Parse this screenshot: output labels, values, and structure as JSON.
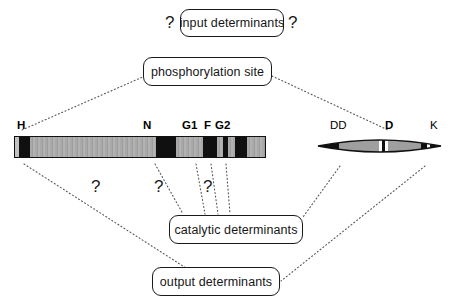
{
  "diagram": {
    "background_color": "#ffffff",
    "line_color": "#555555",
    "stroke_color": "#1a1a1a",
    "bar_fill_color": "#a8a8a8",
    "motif_fill_color": "#101010"
  },
  "nodes": {
    "input": {
      "label": "input determinants",
      "x": 180,
      "y": 9,
      "w": 104,
      "h": 28
    },
    "phospho": {
      "label": "phosphorylation site",
      "x": 143,
      "y": 57,
      "w": 129,
      "h": 29
    },
    "catalytic": {
      "label": "catalytic determinants",
      "x": 169,
      "y": 215,
      "w": 134,
      "h": 29
    },
    "output": {
      "label": "output determinants",
      "x": 152,
      "y": 267,
      "w": 128,
      "h": 29
    }
  },
  "question_marks": [
    {
      "name": "input-left",
      "label": "?",
      "x": 165,
      "y": 14
    },
    {
      "name": "input-right",
      "label": "?",
      "x": 288,
      "y": 14
    },
    {
      "name": "bar-h",
      "label": "?",
      "x": 91,
      "y": 178
    },
    {
      "name": "bar-n",
      "label": "?",
      "x": 154,
      "y": 178
    },
    {
      "name": "bar-g1",
      "label": "?",
      "x": 203,
      "y": 178
    }
  ],
  "histidine_kinase_bar": {
    "name": "histidine-kinase-domain-bar",
    "x": 14,
    "y": 136,
    "w": 252,
    "h": 22,
    "segments": [
      {
        "name": "n-terminal-light",
        "shade": "light",
        "x": 0,
        "w": 4
      },
      {
        "name": "h-box-motif",
        "shade": "dark",
        "x": 4,
        "w": 11
      },
      {
        "name": "linker-1",
        "shade": "gray",
        "x": 15,
        "w": 126
      },
      {
        "name": "n-box-motif",
        "shade": "dark",
        "x": 141,
        "w": 20
      },
      {
        "name": "linker-2",
        "shade": "gray",
        "x": 161,
        "w": 27
      },
      {
        "name": "g1-box-motif",
        "shade": "dark",
        "x": 188,
        "w": 14
      },
      {
        "name": "linker-3",
        "shade": "gray",
        "x": 202,
        "w": 6
      },
      {
        "name": "f-box-motif",
        "shade": "dark",
        "x": 208,
        "w": 5
      },
      {
        "name": "linker-4",
        "shade": "gray",
        "x": 213,
        "w": 7
      },
      {
        "name": "g2-box-motif",
        "shade": "dark",
        "x": 220,
        "w": 12
      },
      {
        "name": "c-terminal-gray",
        "shade": "gray",
        "x": 232,
        "w": 20
      }
    ],
    "labels": [
      {
        "name": "label-h",
        "text": "H",
        "x": 17,
        "y": 120
      },
      {
        "name": "label-n",
        "text": "N",
        "x": 143,
        "y": 120
      },
      {
        "name": "label-g1",
        "text": "G1",
        "x": 182,
        "y": 120
      },
      {
        "name": "label-f",
        "text": "F",
        "x": 204,
        "y": 120
      },
      {
        "name": "label-g2",
        "text": "G2",
        "x": 215,
        "y": 120
      }
    ]
  },
  "response_regulator_lens": {
    "name": "response-regulator-domain-lens",
    "x": 317,
    "y": 133,
    "w": 125,
    "h": 26,
    "labels": [
      {
        "name": "label-dd",
        "text": "DD",
        "x": 330,
        "y": 120
      },
      {
        "name": "label-d",
        "text": "D",
        "x": 385,
        "y": 120
      },
      {
        "name": "label-k",
        "text": "K",
        "x": 430,
        "y": 120
      }
    ]
  },
  "connectors": [
    {
      "name": "phospho-to-h",
      "from": [
        145,
        76
      ],
      "to": [
        22,
        130
      ]
    },
    {
      "name": "phospho-to-dd",
      "from": [
        272,
        76
      ],
      "to": [
        388,
        130
      ]
    },
    {
      "name": "h-to-output",
      "from": [
        24,
        164
      ],
      "to": [
        186,
        268
      ]
    },
    {
      "name": "n-to-catalytic",
      "from": [
        155,
        164
      ],
      "to": [
        183,
        214
      ]
    },
    {
      "name": "g1-to-catalytic",
      "from": [
        196,
        164
      ],
      "to": [
        205,
        214
      ]
    },
    {
      "name": "f-to-catalytic",
      "from": [
        211,
        164
      ],
      "to": [
        218,
        214
      ]
    },
    {
      "name": "g2-to-catalytic",
      "from": [
        226,
        164
      ],
      "to": [
        230,
        214
      ]
    },
    {
      "name": "dd-to-catalytic",
      "from": [
        340,
        166
      ],
      "to": [
        303,
        217
      ]
    },
    {
      "name": "k-to-output",
      "from": [
        425,
        166
      ],
      "to": [
        281,
        281
      ]
    }
  ]
}
